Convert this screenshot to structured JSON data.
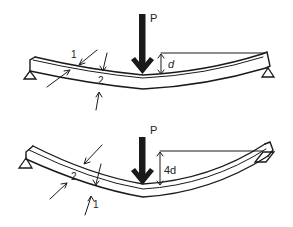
{
  "figure": {
    "colors": {
      "ink": "#1a1a1a",
      "background": "#ffffff"
    }
  },
  "top_beam": {
    "load_label": "P",
    "deflection_label": "d",
    "fiber_labels": [
      "1",
      "2"
    ]
  },
  "bottom_beam": {
    "load_label": "P",
    "deflection_label": "4d",
    "fiber_labels": [
      "2",
      "1"
    ]
  }
}
